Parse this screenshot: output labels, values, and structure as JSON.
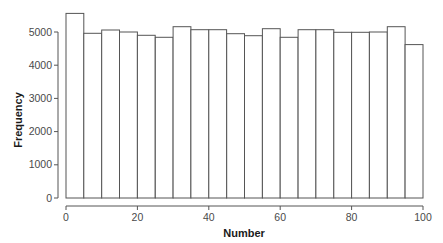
{
  "chart_data": {
    "type": "bar",
    "subtype": "histogram",
    "title": "",
    "xlabel": "Number",
    "ylabel": "Frequency",
    "bin_width": 5,
    "bin_edges": [
      0,
      5,
      10,
      15,
      20,
      25,
      30,
      35,
      40,
      45,
      50,
      55,
      60,
      65,
      70,
      75,
      80,
      85,
      90,
      95,
      100
    ],
    "values": [
      5560,
      4960,
      5060,
      5000,
      4900,
      4840,
      5160,
      5070,
      5070,
      4950,
      4890,
      5100,
      4840,
      5070,
      5070,
      4990,
      4990,
      5000,
      5160,
      4620
    ],
    "xlim": [
      0,
      100
    ],
    "ylim": [
      0,
      5600
    ],
    "xticks": [
      0,
      20,
      40,
      60,
      80,
      100
    ],
    "yticks": [
      0,
      1000,
      2000,
      3000,
      4000,
      5000
    ],
    "grid": false,
    "legend": null,
    "bar_fill": "#ffffff",
    "bar_edge": "#555555",
    "axis_color": "#555555"
  }
}
